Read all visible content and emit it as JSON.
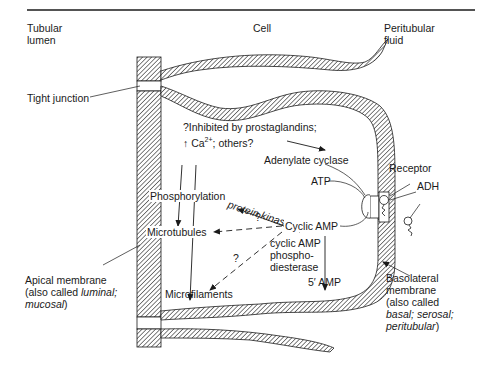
{
  "diagram": {
    "regions": {
      "tubular_lumen": [
        "Tubular",
        "lumen"
      ],
      "cell": "Cell",
      "peritubular_fluid": [
        "Peritubular",
        "fluid"
      ]
    },
    "labels": {
      "tight_junction": "Tight junction",
      "inhibited_line1": "?Inhibited by prostaglandins;",
      "inhibited_line2_arrow": "↑",
      "inhibited_line2_ca": "Ca",
      "inhibited_line2_sup": "2+",
      "inhibited_line2_rest": "; others?",
      "adenylate_cyclase": "Adenylate cyclase",
      "receptor": "Receptor",
      "atp": "ATP",
      "adh": "ADH",
      "phosphorylation": "Phosphorylation",
      "protein_kinase": "protein kinase",
      "cyclic_amp": "Cyclic AMP",
      "microtubules": "Microtubules",
      "question_1": "?",
      "question_2": "?",
      "phosphodiesterase": [
        "cyclic AMP",
        "phospho-",
        "diesterase"
      ],
      "five_amp": "5′ AMP",
      "microfilaments": "Microfilaments",
      "apical_membrane": {
        "line1": "Apical membrane",
        "line2_prefix": "(also called ",
        "line2_italic": "luminal;",
        "line3_italic": "mucosal",
        "line3_suffix": ")"
      },
      "basolateral_membrane": {
        "line1": "Basolateral",
        "line2": "membrane",
        "line3": "(also called",
        "line4_italic": "basal; serosal;",
        "line5_italic": "peritubular",
        "line5_suffix": ")"
      }
    },
    "colors": {
      "ink": "#1a1a1a",
      "hatch": "#2b2b2b",
      "background": "#ffffff"
    }
  }
}
